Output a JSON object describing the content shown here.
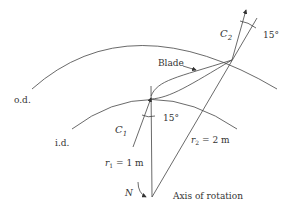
{
  "diagram": {
    "labels": {
      "outer_diameter": "o.d.",
      "inner_diameter": "i.d.",
      "blade": "Blade",
      "inlet_velocity": "C",
      "inlet_velocity_sub": "1",
      "outlet_velocity": "C",
      "outlet_velocity_sub": "2",
      "inlet_angle": "15°",
      "outlet_angle": "15°",
      "r1_var": "r",
      "r1_sub": "1",
      "r1_value": " = 1 m",
      "r2_var": "r",
      "r2_sub": "2",
      "r2_value": " = 2 m",
      "rotation_symbol": "N",
      "axis": "Axis of rotation"
    },
    "values": {
      "r1_m": 1,
      "r2_m": 2,
      "inlet_angle_deg": 15,
      "outlet_angle_deg": 15
    }
  }
}
